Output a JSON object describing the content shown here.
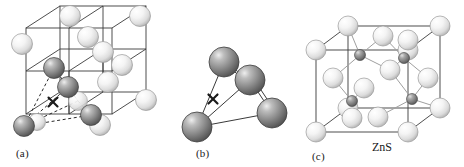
{
  "figure": {
    "background": "#ffffff"
  },
  "colors": {
    "light_sphere_fill": "#f2f2f2",
    "light_sphere_highlight": "#ffffff",
    "light_sphere_shadow": "#b8b8b8",
    "light_sphere_edge": "#9a9a9a",
    "dark_sphere_fill": "#8c8c8c",
    "dark_sphere_highlight": "#e8e8e8",
    "dark_sphere_shadow": "#4a4a4a",
    "dark_sphere_edge": "#3d3d3d",
    "bond_line": "#3a3a3a",
    "light_bond_line": "#9f9f9f",
    "dashed_line": "#2a2a2a",
    "cross_mark": "#1a1a1a",
    "text": "#1a1a1a"
  },
  "panels": [
    {
      "id": "a",
      "label": "(a)",
      "label_x": 16,
      "label_y": 147,
      "caption": "",
      "description": "Face-centered cubic lattice of large spheres with a tetrahedral hole marked by an x",
      "marker": {
        "symbol": "×",
        "x": 53,
        "y": 102
      },
      "cube": {
        "origin_x": 26,
        "origin_y": 28,
        "width": 86,
        "height": 86,
        "depth_x": 34,
        "depth_y": -22
      },
      "light_spheres": [
        {
          "cx": 70,
          "cy": 16,
          "r": 10.5
        },
        {
          "cx": 140,
          "cy": 16,
          "r": 10.5
        },
        {
          "cx": 22,
          "cy": 44,
          "r": 10.5
        },
        {
          "cx": 88,
          "cy": 37,
          "r": 10.5
        },
        {
          "cx": 103,
          "cy": 52,
          "r": 10.5
        },
        {
          "cx": 122,
          "cy": 65,
          "r": 10.5
        },
        {
          "cx": 108,
          "cy": 82,
          "r": 10.5
        },
        {
          "cx": 146,
          "cy": 100,
          "r": 10.5
        },
        {
          "cx": 78,
          "cy": 101,
          "r": 9.5
        },
        {
          "cx": 100,
          "cy": 125,
          "r": 10.5
        },
        {
          "cx": 37,
          "cy": 122,
          "r": 8.5
        }
      ],
      "dark_spheres": [
        {
          "cx": 54,
          "cy": 68,
          "r": 10.5
        },
        {
          "cx": 68,
          "cy": 87,
          "r": 10.5
        },
        {
          "cx": 91,
          "cy": 115,
          "r": 10.5
        },
        {
          "cx": 24,
          "cy": 126,
          "r": 10.5
        }
      ]
    },
    {
      "id": "b",
      "label": "(b)",
      "label_x": 196,
      "label_y": 147,
      "caption": "",
      "description": "Isolated tetrahedron of four spheres surrounding a central x site",
      "marker": {
        "symbol": "×",
        "x": 213,
        "y": 99
      },
      "dark_spheres": [
        {
          "cx": 224,
          "cy": 62,
          "r": 15
        },
        {
          "cx": 250,
          "cy": 80,
          "r": 15
        },
        {
          "cx": 272,
          "cy": 113,
          "r": 15
        },
        {
          "cx": 197,
          "cy": 127,
          "r": 15
        }
      ],
      "bonds": [
        {
          "x1": 224,
          "y1": 62,
          "x2": 197,
          "y2": 127
        },
        {
          "x1": 224,
          "y1": 62,
          "x2": 250,
          "y2": 80
        },
        {
          "x1": 250,
          "y1": 80,
          "x2": 272,
          "y2": 113
        },
        {
          "x1": 250,
          "y1": 80,
          "x2": 197,
          "y2": 127
        },
        {
          "x1": 197,
          "y1": 127,
          "x2": 272,
          "y2": 113
        }
      ]
    },
    {
      "id": "c",
      "label": "(c)",
      "label_x": 312,
      "label_y": 150,
      "caption": "ZnS",
      "caption_x": 372,
      "caption_y": 146,
      "description": "Zinc blende unit cell: sulfur atoms on an fcc lattice with zinc atoms in half the tetrahedral holes",
      "cube": {
        "origin_x": 316,
        "origin_y": 50,
        "width": 92,
        "height": 82,
        "depth_x": 32,
        "depth_y": -24
      },
      "large_spheres": [
        {
          "cx": 316,
          "cy": 50,
          "r": 10,
          "role": "corner"
        },
        {
          "cx": 408,
          "cy": 50,
          "r": 10,
          "role": "corner"
        },
        {
          "cx": 348,
          "cy": 26,
          "r": 10,
          "role": "corner"
        },
        {
          "cx": 440,
          "cy": 26,
          "r": 10,
          "role": "corner"
        },
        {
          "cx": 316,
          "cy": 132,
          "r": 10,
          "role": "corner"
        },
        {
          "cx": 408,
          "cy": 132,
          "r": 10,
          "role": "corner"
        },
        {
          "cx": 348,
          "cy": 108,
          "r": 10,
          "role": "corner"
        },
        {
          "cx": 440,
          "cy": 108,
          "r": 10,
          "role": "corner"
        },
        {
          "cx": 383,
          "cy": 36,
          "r": 10,
          "role": "face-top"
        },
        {
          "cx": 408,
          "cy": 40,
          "r": 10,
          "role": "face-top"
        },
        {
          "cx": 378,
          "cy": 117,
          "r": 10,
          "role": "face-bottom"
        },
        {
          "cx": 352,
          "cy": 118,
          "r": 10,
          "role": "face-bottom"
        },
        {
          "cx": 333,
          "cy": 78,
          "r": 10,
          "role": "face-left"
        },
        {
          "cx": 428,
          "cy": 78,
          "r": 10,
          "role": "face-right"
        },
        {
          "cx": 390,
          "cy": 70,
          "r": 10,
          "role": "face-back"
        },
        {
          "cx": 364,
          "cy": 88,
          "r": 10,
          "role": "face-front"
        }
      ],
      "small_spheres": [
        {
          "cx": 360,
          "cy": 55,
          "r": 5.5
        },
        {
          "cx": 404,
          "cy": 58,
          "r": 5.5
        },
        {
          "cx": 352,
          "cy": 101,
          "r": 5.5
        },
        {
          "cx": 412,
          "cy": 99,
          "r": 5.5
        }
      ],
      "bonds": [
        {
          "x1": 360,
          "y1": 55,
          "x2": 348,
          "y2": 26
        },
        {
          "x1": 360,
          "y1": 55,
          "x2": 383,
          "y2": 36
        },
        {
          "x1": 360,
          "y1": 55,
          "x2": 333,
          "y2": 78
        },
        {
          "x1": 360,
          "y1": 55,
          "x2": 390,
          "y2": 70
        },
        {
          "x1": 404,
          "y1": 58,
          "x2": 383,
          "y2": 36
        },
        {
          "x1": 404,
          "y1": 58,
          "x2": 408,
          "y2": 40
        },
        {
          "x1": 404,
          "y1": 58,
          "x2": 390,
          "y2": 70
        },
        {
          "x1": 404,
          "y1": 58,
          "x2": 428,
          "y2": 78
        },
        {
          "x1": 352,
          "y1": 101,
          "x2": 333,
          "y2": 78
        },
        {
          "x1": 352,
          "y1": 101,
          "x2": 348,
          "y2": 108
        },
        {
          "x1": 352,
          "y1": 101,
          "x2": 364,
          "y2": 88
        },
        {
          "x1": 352,
          "y1": 101,
          "x2": 352,
          "y2": 118
        },
        {
          "x1": 412,
          "y1": 99,
          "x2": 428,
          "y2": 78
        },
        {
          "x1": 412,
          "y1": 99,
          "x2": 390,
          "y2": 70
        },
        {
          "x1": 412,
          "y1": 99,
          "x2": 440,
          "y2": 108
        },
        {
          "x1": 412,
          "y1": 99,
          "x2": 378,
          "y2": 117
        }
      ]
    }
  ]
}
